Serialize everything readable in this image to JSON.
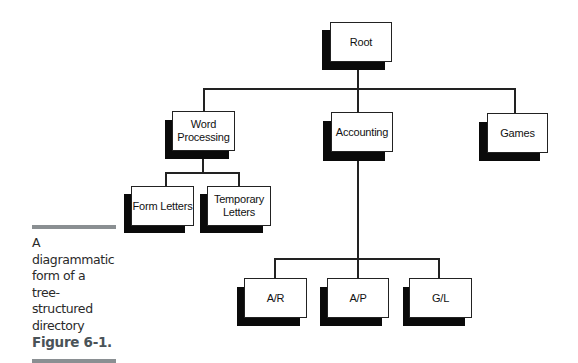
{
  "diagram": {
    "type": "tree",
    "nodes": {
      "root": {
        "label": "Root"
      },
      "word_processing": {
        "label": "Word\nProcessing"
      },
      "accounting": {
        "label": "Accounting"
      },
      "games": {
        "label": "Games"
      },
      "form_letters": {
        "label": "Form Letters"
      },
      "temporary_letters": {
        "label": "Temporary\nLetters"
      },
      "ar": {
        "label": "A/R"
      },
      "ap": {
        "label": "A/P"
      },
      "gl": {
        "label": "G/L"
      }
    },
    "edges": [
      [
        "Root",
        "Word Processing"
      ],
      [
        "Root",
        "Accounting"
      ],
      [
        "Root",
        "Games"
      ],
      [
        "Word Processing",
        "Form Letters"
      ],
      [
        "Word Processing",
        "Temporary Letters"
      ],
      [
        "Accounting",
        "A/R"
      ],
      [
        "Accounting",
        "A/P"
      ],
      [
        "Accounting",
        "G/L"
      ]
    ]
  },
  "caption": {
    "text": "A diagrammatic\nform of a tree-\nstructured\ndirectory",
    "figure_label": "Figure 6-1."
  },
  "colors": {
    "box_border": "#222222",
    "shadow": "#0a0a0a",
    "caption_bar": "#8a8f92",
    "figure_label": "#4a5358"
  }
}
